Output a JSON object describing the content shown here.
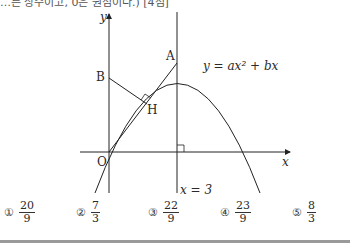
{
  "header": {
    "clipped_text": "…른 상수이고, 0은 원점이다.) [4점]"
  },
  "figure": {
    "axis_x_label": "x",
    "axis_y_label": "y",
    "origin_label": "O",
    "point_a_label": "A",
    "point_b_label": "B",
    "point_h_label": "H",
    "curve_label": "y = ax² + bx",
    "line_label": "x = 3"
  },
  "choices": [
    {
      "marker": "①",
      "numerator": "20",
      "denominator": "9"
    },
    {
      "marker": "②",
      "numerator": "7",
      "denominator": "3"
    },
    {
      "marker": "③",
      "numerator": "22",
      "denominator": "9"
    },
    {
      "marker": "④",
      "numerator": "23",
      "denominator": "9"
    },
    {
      "marker": "⑤",
      "numerator": "8",
      "denominator": "3"
    }
  ]
}
